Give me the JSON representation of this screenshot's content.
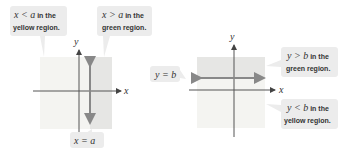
{
  "colors": {
    "yellow_region": "#f4f4f1",
    "green_region": "#e6e6e4",
    "callout_bg": "#ececec",
    "axis": "#555555",
    "boundary_line": "#888888"
  },
  "left_panel": {
    "x_axis_label": "x",
    "y_axis_label": "y",
    "boundary_label": "x = a",
    "callout_left": {
      "line1_math": "x < a",
      "line1_text": " in the",
      "line2": "yellow region."
    },
    "callout_right": {
      "line1_math": "x > a",
      "line1_text": " in the",
      "line2": "green region."
    }
  },
  "right_panel": {
    "x_axis_label": "x",
    "y_axis_label": "y",
    "boundary_label": "y = b",
    "callout_top": {
      "line1_math": "y > b",
      "line1_text": " in the",
      "line2": "green region."
    },
    "callout_bottom": {
      "line1_math": "y < b",
      "line1_text": " in the",
      "line2": "yellow region."
    }
  }
}
